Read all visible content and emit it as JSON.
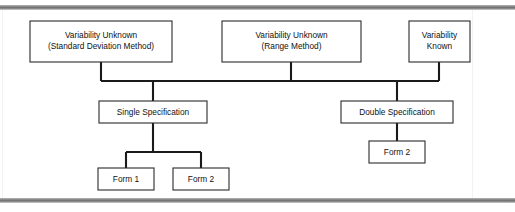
{
  "figure": {
    "top_rule_label": "top-divider-rule",
    "bottom_rule_label": "bottom-divider-rule"
  },
  "diagram": {
    "type": "hierarchy-tree",
    "level1": [
      {
        "id": "variability-unknown-sd",
        "line1": "Variability Unknown",
        "line2": "(Standard Deviation Method)",
        "box": {
          "x": 30,
          "y": 21,
          "w": 142,
          "h": 41
        },
        "drop_x": 101
      },
      {
        "id": "variability-unknown-range",
        "line1": "Variability Unknown",
        "line2": "(Range Method)",
        "box": {
          "x": 222,
          "y": 21,
          "w": 139,
          "h": 41
        },
        "drop_x": 291
      },
      {
        "id": "variability-known",
        "line1": "Variability",
        "line2": "Known",
        "box": {
          "x": 409,
          "y": 21,
          "w": 61,
          "h": 41
        },
        "drop_x": 439
      }
    ],
    "bus": {
      "y": 81,
      "x_start": 101,
      "x_end": 439
    },
    "level2": [
      {
        "id": "single-specification",
        "line1": "Single Specification",
        "line2": "",
        "box": {
          "x": 99,
          "y": 101,
          "w": 108,
          "h": 22
        },
        "drop_x": 153
      },
      {
        "id": "double-specification",
        "line1": "Double Specification",
        "line2": "",
        "box": {
          "x": 341,
          "y": 101,
          "w": 112,
          "h": 22
        },
        "drop_x": 397
      }
    ],
    "level3": [
      {
        "id": "single-form-1",
        "line1": "Form 1",
        "line2": "",
        "box": {
          "x": 98,
          "y": 168,
          "w": 56,
          "h": 22
        },
        "drop_x": 126,
        "parent": "single-specification"
      },
      {
        "id": "single-form-2",
        "line1": "Form 2",
        "line2": "",
        "box": {
          "x": 173,
          "y": 168,
          "w": 56,
          "h": 22
        },
        "drop_x": 201,
        "parent": "single-specification"
      },
      {
        "id": "double-form-2",
        "line1": "Form 2",
        "line2": "",
        "box": {
          "x": 369,
          "y": 141,
          "w": 56,
          "h": 22
        },
        "drop_x": 397,
        "parent": "double-specification"
      }
    ],
    "fan": {
      "single_bar_y": 152,
      "single_bar_x_start": 126,
      "single_bar_x_end": 201
    },
    "colors": {
      "line": "#1a1a1a",
      "box_stroke": "#2a2a2a",
      "box_fill": "#ffffff",
      "text": "#111111",
      "rule": "#6f6f6f",
      "background": "#ffffff"
    }
  }
}
